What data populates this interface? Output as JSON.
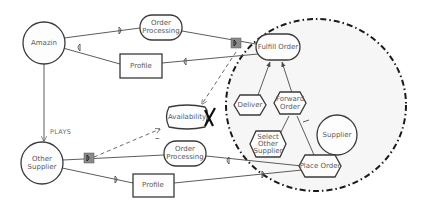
{
  "diagram": {
    "type": "i* strategic dependency / rationale model",
    "boundary_actor": "Supplier",
    "actors": {
      "amazin": "Amazin",
      "other_supplier": "Other Supplier",
      "supplier": "Supplier"
    },
    "relation_label": "PLAYS",
    "resources": {
      "order_processing_top": [
        "Order",
        "Processing"
      ],
      "order_processing_bottom": [
        "Order",
        "Processing"
      ],
      "profile_top": "Profile",
      "profile_bottom": "Profile"
    },
    "goals": {
      "fulfill_order": "Fulfill Order",
      "availability": "Availability"
    },
    "tasks": {
      "deliver": "Deliver",
      "forward_order": [
        "Forward",
        "Order"
      ],
      "select_other_supplier": [
        "Select",
        "Other",
        "Supplier"
      ],
      "place_order": "Place Order"
    },
    "annotations": {
      "minus_sign": "–",
      "denied_mark": "X"
    },
    "colors": {
      "stroke": "#3a3a3a",
      "boundary_fill": "#f6f6f6",
      "marker_box": "#8a8a8a"
    }
  }
}
